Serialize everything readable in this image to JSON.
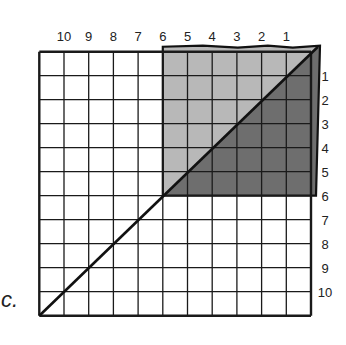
{
  "panel": {
    "label": "c."
  },
  "grid": {
    "columns": 11,
    "rows": 11,
    "left": 39.3,
    "top": 51.7,
    "cell_width": 24.7,
    "cell_height": 24.0,
    "line_color": "#1a1a1a"
  },
  "top_labels": [
    "10",
    "9",
    "8",
    "7",
    "6",
    "5",
    "4",
    "3",
    "2",
    "1"
  ],
  "right_labels": [
    "1",
    "2",
    "3",
    "4",
    "5",
    "6",
    "7",
    "8",
    "9",
    "10"
  ],
  "shaded_square": {
    "from_column_line": 5,
    "to_row_line": 6,
    "light_color": "#b8b8b8",
    "dark_color": "#6e6e6e"
  },
  "diagonal": {
    "from": "bottom-left",
    "to": "top-right",
    "color": "#111111"
  }
}
